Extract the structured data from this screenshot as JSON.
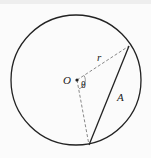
{
  "diagram": {
    "type": "circle-segment",
    "labels": {
      "center": "O",
      "radius": "r",
      "angle": "θ",
      "segment": "A"
    },
    "colors": {
      "stroke": "#222222",
      "dashed": "#888888",
      "background": "#fbfbfb"
    }
  }
}
